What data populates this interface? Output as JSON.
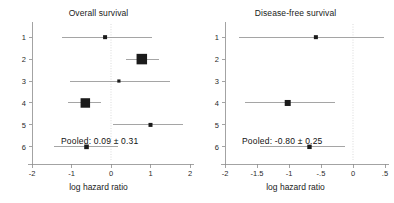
{
  "figure": {
    "width": 394,
    "height": 203,
    "background": "#ffffff",
    "marker_color": "#1b1b1b",
    "ci_color": "#8e8e8e",
    "axis_color": "#8c8c8c",
    "zero_line_color": "#d2d2d2"
  },
  "chart_data": [
    {
      "type": "forest",
      "panel_id": "overall-survival",
      "title": "Overall survival",
      "xlabel": "log hazard ratio",
      "ylabel": "",
      "xlim": [
        -2,
        2
      ],
      "ylim": [
        0.4,
        6.6
      ],
      "grid": false,
      "zero_reference": 0,
      "xticks": [
        -2,
        -1,
        0,
        1,
        2
      ],
      "xticklabels": [
        "-2",
        "-1",
        "0",
        "1",
        "2"
      ],
      "yticks": [
        1,
        2,
        3,
        4,
        5,
        6
      ],
      "yticklabels": [
        "1",
        "2",
        "3",
        "4",
        "5",
        "6"
      ],
      "annotation": "Pooled: 0.09 ± 0.31",
      "pooled_estimate": 0.09,
      "pooled_error": 0.31,
      "studies": [
        {
          "label": "1",
          "y": 1,
          "estimate": -0.15,
          "ci_low": -1.25,
          "ci_high": 1.05,
          "weight_size": 4.0
        },
        {
          "label": "2",
          "y": 2,
          "estimate": 0.78,
          "ci_low": 0.37,
          "ci_high": 1.22,
          "weight_size": 10.5
        },
        {
          "label": "3",
          "y": 3,
          "estimate": 0.2,
          "ci_low": -1.05,
          "ci_high": 1.5,
          "weight_size": 3.2
        },
        {
          "label": "4",
          "y": 4,
          "estimate": -0.65,
          "ci_low": -1.1,
          "ci_high": -0.25,
          "weight_size": 9.5
        },
        {
          "label": "5",
          "y": 5,
          "estimate": 1.0,
          "ci_low": 0.05,
          "ci_high": 1.82,
          "weight_size": 4.0
        },
        {
          "label": "6",
          "y": 6,
          "estimate": -0.62,
          "ci_low": -1.45,
          "ci_high": 0.18,
          "weight_size": 4.6
        }
      ]
    },
    {
      "type": "forest",
      "panel_id": "disease-free-survival",
      "title": "Disease-free survival",
      "xlabel": "log hazard ratio",
      "ylabel": "",
      "xlim": [
        -2,
        0.5
      ],
      "ylim": [
        0.4,
        6.6
      ],
      "grid": false,
      "zero_reference": 0,
      "xticks": [
        -2,
        -1.5,
        -1,
        -0.5,
        0,
        0.5
      ],
      "xticklabels": [
        "-2",
        "-1.5",
        "-1",
        "-.5",
        "0",
        ".5"
      ],
      "yticks": [
        1,
        2,
        3,
        4,
        5,
        6
      ],
      "yticklabels": [
        "1",
        "2",
        "3",
        "4",
        "5",
        "6"
      ],
      "annotation": "Pooled: -0.80 ± 0.25",
      "pooled_estimate": -0.8,
      "pooled_error": 0.25,
      "studies": [
        {
          "label": "1",
          "y": 1,
          "estimate": -0.58,
          "ci_low": -1.78,
          "ci_high": 0.48,
          "weight_size": 4.0
        },
        {
          "label": "2",
          "y": 2,
          "estimate": null,
          "ci_low": null,
          "ci_high": null,
          "weight_size": 0
        },
        {
          "label": "3",
          "y": 3,
          "estimate": null,
          "ci_low": null,
          "ci_high": null,
          "weight_size": 0
        },
        {
          "label": "4",
          "y": 4,
          "estimate": -1.02,
          "ci_low": -1.68,
          "ci_high": -0.28,
          "weight_size": 6.0
        },
        {
          "label": "5",
          "y": 5,
          "estimate": null,
          "ci_low": null,
          "ci_high": null,
          "weight_size": 0
        },
        {
          "label": "6",
          "y": 6,
          "estimate": -0.68,
          "ci_low": -1.45,
          "ci_high": -0.12,
          "weight_size": 4.4
        }
      ]
    }
  ]
}
